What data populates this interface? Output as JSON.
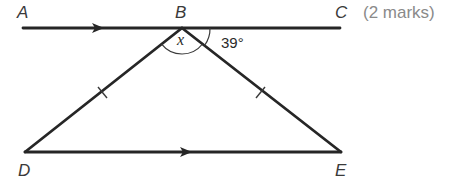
{
  "diagram": {
    "points": {
      "A": {
        "label": "A",
        "x": 23,
        "y": 28
      },
      "B": {
        "label": "B",
        "x": 182,
        "y": 28
      },
      "C": {
        "label": "C",
        "x": 340,
        "y": 28
      },
      "D": {
        "label": "D",
        "x": 25,
        "y": 152
      },
      "E": {
        "label": "E",
        "x": 341,
        "y": 152
      }
    },
    "segments": [
      {
        "from": "A",
        "to": "C",
        "parallel_arrow": true
      },
      {
        "from": "D",
        "to": "E",
        "parallel_arrow": true
      },
      {
        "from": "B",
        "to": "D",
        "equal_tick": 1
      },
      {
        "from": "B",
        "to": "E",
        "equal_tick": 1
      }
    ],
    "angles": {
      "x": {
        "label": "x",
        "vertex": "B",
        "between": [
          "D",
          "E"
        ]
      },
      "given": {
        "label": "39°",
        "vertex": "B",
        "between": [
          "E",
          "C"
        ],
        "value_deg": 39
      }
    },
    "marks_label": "(2 marks)"
  },
  "colors": {
    "line": "#262626",
    "label": "#3a3a3a",
    "marks": "#8a8a8a",
    "background": "#ffffff"
  }
}
